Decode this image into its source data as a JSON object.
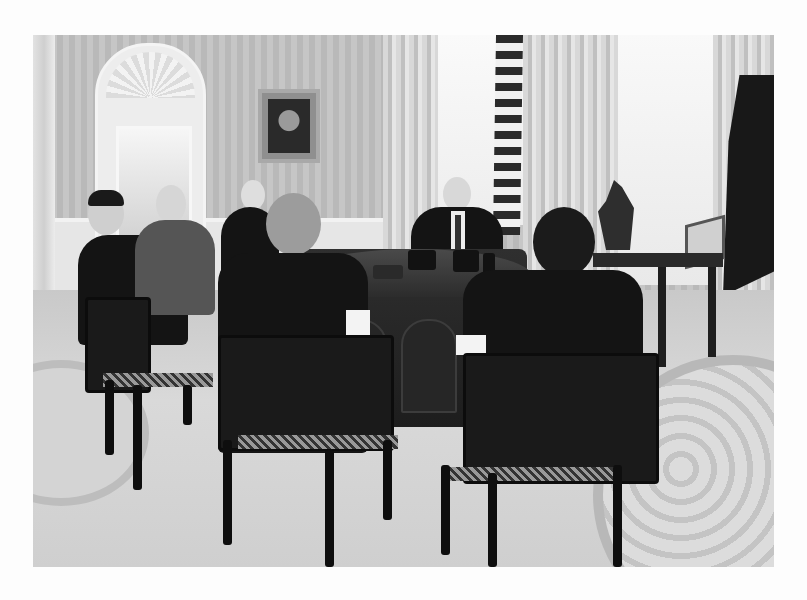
{
  "photo": {
    "description": "Black-and-white photograph of a meeting in an oval office",
    "scene_elements": [
      "striped-wall",
      "arched-door-with-shell-motif",
      "framed-portrait",
      "curtained-windows",
      "us-flag",
      "presidential-flag",
      "ornate-desk-with-phones",
      "side-table-with-equestrian-statue",
      "small-picture-frame",
      "oval-rug",
      "seated-men-in-suits",
      "cane-back-chairs"
    ],
    "people_count": 7,
    "colors": {
      "background": "#fdfdfd",
      "wall": "#c0c0c0",
      "suit": "#141414",
      "floor": "#d3d3d3"
    }
  }
}
